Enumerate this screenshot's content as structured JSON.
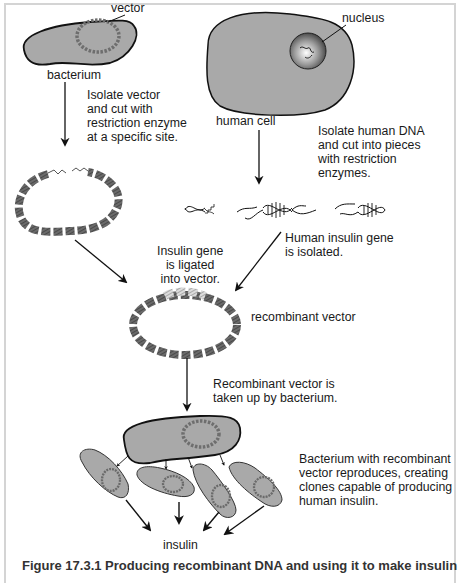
{
  "figure": {
    "labels": {
      "vector": "vector",
      "bacterium": "bacterium",
      "nucleus": "nucleus",
      "human_cell": "human cell",
      "recombinant_vector": "recombinant vector",
      "insulin": "insulin"
    },
    "steps": {
      "isolate_vector": "Isolate vector\nand cut with\nrestriction enzyme\nat a specific site.",
      "isolate_dna": "Isolate human DNA\nand cut into pieces\nwith restriction\nenzymes.",
      "gene_isolated": "Human insulin gene\nis isolated.",
      "gene_ligated": "Insulin gene\nis ligated\ninto vector.",
      "taken_up": "Recombinant vector is\ntaken up by bacterium.",
      "reproduces": "Bacterium with recombinant\nvector reproduces, creating\nclones capable of producing\nhuman insulin."
    },
    "caption": "Figure 17.3.1  Producing recombinant DNA and using it to make insulin",
    "colors": {
      "cell_fill": "#a9a9a9",
      "outline": "#111111",
      "dna_dark": "#5e5e5e",
      "dna_light": "#c9c9c9",
      "frame": "#d4d4d4"
    }
  }
}
